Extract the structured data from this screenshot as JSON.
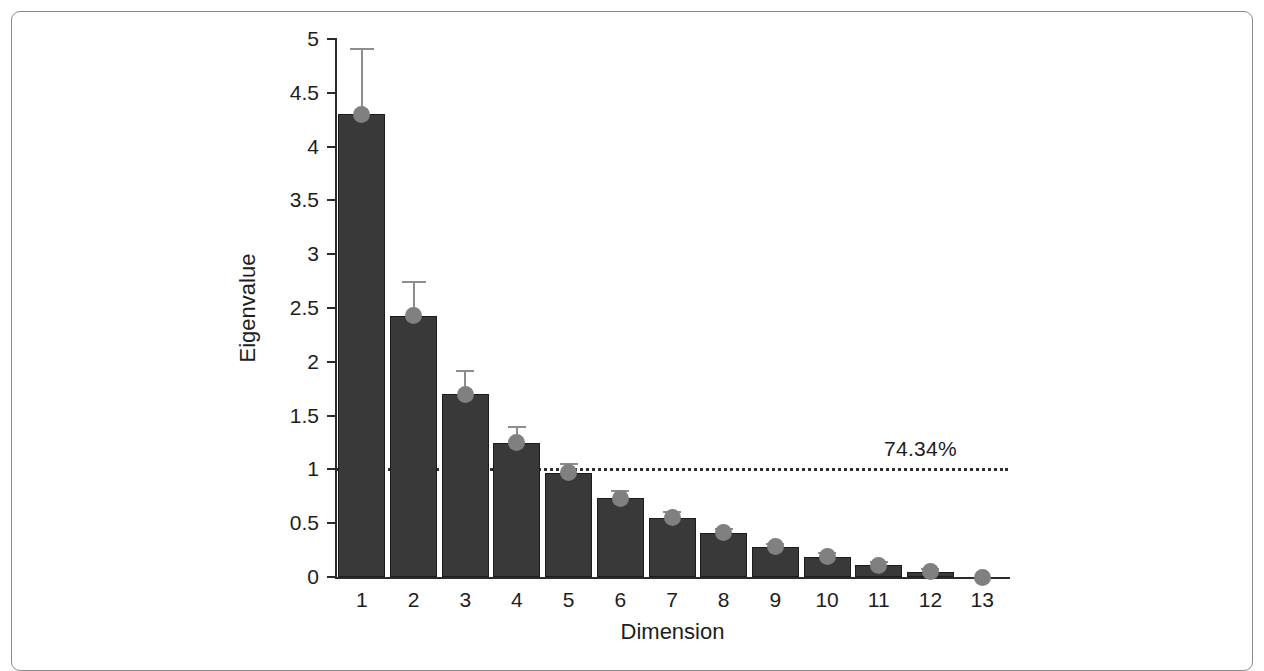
{
  "chart_data": {
    "type": "bar",
    "title": "",
    "subtitle": "",
    "xlabel": "Dimension",
    "ylabel": "Eigenvalue",
    "categories": [
      "1",
      "2",
      "3",
      "4",
      "5",
      "6",
      "7",
      "8",
      "9",
      "10",
      "11",
      "12",
      "13"
    ],
    "values": [
      4.3,
      2.43,
      1.7,
      1.25,
      0.97,
      0.73,
      0.55,
      0.41,
      0.28,
      0.19,
      0.11,
      0.05,
      0.0
    ],
    "error_upper": [
      4.92,
      2.75,
      1.92,
      1.4,
      1.06,
      0.81,
      0.61,
      0.46,
      0.32,
      0.23,
      0.15,
      0.08,
      0.0
    ],
    "error_lower": [
      3.68,
      2.11,
      1.48,
      1.1,
      0.88,
      0.65,
      0.49,
      0.36,
      0.24,
      0.15,
      0.07,
      0.02,
      0.0
    ],
    "markers": [
      4.3,
      2.43,
      1.7,
      1.25,
      0.97,
      0.73,
      0.55,
      0.41,
      0.28,
      0.19,
      0.11,
      0.05,
      0.0
    ],
    "ylim": [
      0,
      5
    ],
    "xlim_categories": 13,
    "yticks": [
      0,
      0.5,
      1,
      1.5,
      2,
      2.5,
      3,
      3.5,
      4,
      4.5,
      5
    ],
    "ytick_labels": [
      "0",
      "0.5",
      "1",
      "1.5",
      "2",
      "2.5",
      "3",
      "3.5",
      "4",
      "4.5",
      "5"
    ],
    "grid": false,
    "legend": false,
    "legend_position": "none",
    "annotations": [
      {
        "name": "cumulative-variance-threshold",
        "text": "74.34%",
        "y_value": 1.0,
        "line_style": "dotted",
        "description": "Horizontal reference line at eigenvalue = 1 (Kaiser criterion) labelled with cumulative explained variance"
      }
    ],
    "colors": {
      "bar_fill": "#393939",
      "bar_edge": "#1c1c1c",
      "marker": "#808080",
      "error_bar": "#8d8d8d",
      "threshold_line": "#2f2f2f",
      "axis": "#2b2b2b",
      "text": "#1d1d1d",
      "background": "#ffffff",
      "frame_border": "#8a8a8a"
    }
  }
}
